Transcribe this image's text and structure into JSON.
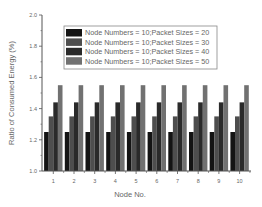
{
  "chart_data": {
    "type": "bar",
    "title": "",
    "xlabel": "Node No.",
    "ylabel": "Ratio of Consumed Energy (%)",
    "ylim": [
      1.0,
      2.0
    ],
    "yticks": [
      1.0,
      1.2,
      1.4,
      1.6,
      1.8,
      2.0
    ],
    "ytick_labels": [
      "1.0",
      "1.2",
      "1.4",
      "1.6",
      "1.8",
      "2.0"
    ],
    "grid": false,
    "legend_position": "upper center",
    "categories": [
      "1",
      "2",
      "3",
      "4",
      "5",
      "6",
      "7",
      "8",
      "9",
      "10"
    ],
    "series": [
      {
        "name": "Node Numbers = 10;Packet Sizes = 20",
        "color": "#141414",
        "values": [
          1.25,
          1.25,
          1.25,
          1.25,
          1.25,
          1.25,
          1.25,
          1.25,
          1.25,
          1.25
        ]
      },
      {
        "name": "Node Numbers = 10;Packet Sizes = 30",
        "color": "#4e4e4e",
        "values": [
          1.35,
          1.35,
          1.35,
          1.35,
          1.35,
          1.35,
          1.35,
          1.35,
          1.35,
          1.35
        ]
      },
      {
        "name": "Node Numbers = 10;Packet Sizes = 40",
        "color": "#2a2a2a",
        "values": [
          1.44,
          1.44,
          1.44,
          1.44,
          1.44,
          1.44,
          1.44,
          1.44,
          1.44,
          1.44
        ]
      },
      {
        "name": "Node Numbers = 10;Packet Sizes = 50",
        "color": "#717171",
        "values": [
          1.55,
          1.55,
          1.55,
          1.55,
          1.55,
          1.55,
          1.55,
          1.55,
          1.55,
          1.55
        ]
      }
    ]
  }
}
